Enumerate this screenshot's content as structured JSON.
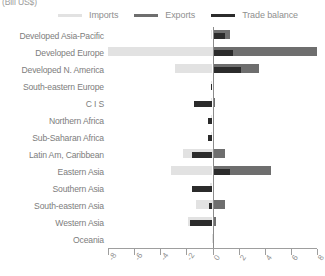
{
  "unit_label": "(Bill US$)",
  "legend": {
    "items": [
      {
        "label": "Imports",
        "color": "#e2e2e2",
        "name": "imports"
      },
      {
        "label": "Exports",
        "color": "#6e6e6e",
        "name": "exports"
      },
      {
        "label": "Trade balance",
        "color": "#2b2b2b",
        "name": "trade-balance"
      }
    ]
  },
  "chart_data": {
    "type": "bar",
    "orientation": "horizontal",
    "title": "",
    "subtitle": "",
    "xlabel": "(Bill US$)",
    "ylabel": "",
    "xlim": [
      -8,
      8
    ],
    "xticks": [
      -8,
      -6,
      -4,
      -2,
      0,
      2,
      4,
      6,
      8
    ],
    "xtick_labels": [
      "-8",
      "-6",
      "-4",
      "-2",
      "0",
      "2",
      "4",
      "6",
      "8"
    ],
    "grid": false,
    "legend_position": "top",
    "zero_line": true,
    "categories": [
      "Developed Asia-Pacific",
      "Developed Europe",
      "Developed N. America",
      "South-eastern Europe",
      "C I S",
      "Northern Africa",
      "Sub-Saharan Africa",
      "Latin Am, Caribbean",
      "Eastern Asia",
      "Southern Asia",
      "South-eastern Asia",
      "Western Asia",
      "Oceania"
    ],
    "series": [
      {
        "name": "Imports",
        "color": "#e2e2e2",
        "values": [
          -0.15,
          -8.0,
          -2.85,
          -0.1,
          -0.15,
          -0.1,
          -0.1,
          -2.25,
          -3.2,
          -0.2,
          -1.25,
          -1.9,
          -0.02
        ]
      },
      {
        "name": "Exports",
        "color": "#6e6e6e",
        "values": [
          1.35,
          8.0,
          3.55,
          0.12,
          0.18,
          0.12,
          0.12,
          0.95,
          4.5,
          0.15,
          0.95,
          0.3,
          0.02
        ]
      },
      {
        "name": "Trade balance",
        "color": "#2b2b2b",
        "values": [
          0.95,
          1.6,
          2.2,
          -0.1,
          -1.45,
          -0.35,
          -0.35,
          -1.55,
          1.35,
          -1.6,
          -0.3,
          -1.7,
          0.0
        ]
      }
    ]
  }
}
